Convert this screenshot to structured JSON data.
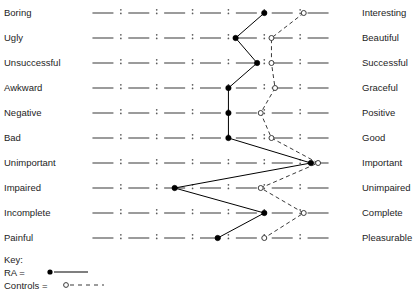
{
  "chart_data": {
    "type": "line",
    "title": "",
    "subtitle": "",
    "xlabel": "",
    "ylabel": "",
    "scale_points": 7,
    "xlim": [
      1,
      7
    ],
    "grid": false,
    "legend_position": "bottom-left",
    "orientation": "horizontal-semantic-differential",
    "categories": [
      "Boring / Interesting",
      "Ugly / Beautiful",
      "Unsuccessful / Successful",
      "Awkward / Graceful",
      "Negative / Positive",
      "Bad / Good",
      "Unimportant / Important",
      "Impaired / Unimpaired",
      "Incomplete / Complete",
      "Painful / Pleasurable"
    ],
    "left_labels": [
      "Boring",
      "Ugly",
      "Unsuccessful",
      "Awkward",
      "Negative",
      "Bad",
      "Unimportant",
      "Impaired",
      "Incomplete",
      "Painful"
    ],
    "right_labels": [
      "Interesting",
      "Beautiful",
      "Successful",
      "Graceful",
      "Positive",
      "Good",
      "Important",
      "Unimpaired",
      "Complete",
      "Pleasurable"
    ],
    "series": [
      {
        "name": "RA",
        "marker": "filled-circle",
        "line": "solid",
        "color": "#000000",
        "values": [
          5.5,
          4.7,
          5.3,
          4.5,
          4.5,
          4.5,
          6.8,
          3.0,
          5.5,
          4.2
        ]
      },
      {
        "name": "Controls",
        "marker": "open-circle",
        "line": "dashed",
        "color": "#3a3a3a",
        "values": [
          6.6,
          5.7,
          5.7,
          5.8,
          5.4,
          5.7,
          7.0,
          5.4,
          6.6,
          5.5
        ]
      }
    ]
  },
  "legend": {
    "title": "Key:",
    "entries": [
      {
        "label": "RA =",
        "marker": "filled-circle",
        "line": "solid"
      },
      {
        "label": "Controls =",
        "marker": "open-circle",
        "line": "dashed"
      }
    ]
  }
}
